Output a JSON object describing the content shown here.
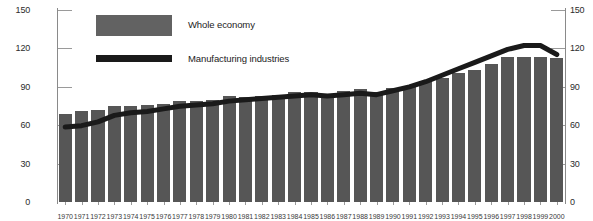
{
  "chart_data": {
    "type": "bar",
    "title": "",
    "subtitle": "",
    "xlabel": "",
    "ylabel": "",
    "ylim": [
      0,
      150
    ],
    "yticks": [
      0,
      30,
      60,
      90,
      120,
      150
    ],
    "grid": false,
    "legend_position": "top-left",
    "dual_axis": true,
    "categories": [
      "1970",
      "1971",
      "1972",
      "1973",
      "1974",
      "1975",
      "1976",
      "1977",
      "1978",
      "1979",
      "1980",
      "1981",
      "1982",
      "1983",
      "1984",
      "1985",
      "1986",
      "1987",
      "1988",
      "1989",
      "1990",
      "1991",
      "1992",
      "1993",
      "1994",
      "1995",
      "1996",
      "1997",
      "1998",
      "1999",
      "2000"
    ],
    "series": [
      {
        "name": "Whole economy",
        "type": "bar",
        "color": "#565656",
        "values": [
          68,
          70,
          71,
          74,
          74,
          75,
          76,
          78,
          78,
          79,
          82,
          81,
          82,
          83,
          85,
          85,
          83,
          86,
          87,
          85,
          88,
          90,
          93,
          96,
          100,
          102,
          107,
          112,
          112,
          112,
          111
        ]
      },
      {
        "name": "Manufacturing industries",
        "type": "line",
        "color": "#1a1a1a",
        "values": [
          58,
          59,
          62,
          67,
          69,
          70,
          72,
          74,
          75,
          76,
          78,
          79,
          80,
          81,
          82,
          83,
          82,
          83,
          84,
          83,
          86,
          89,
          93,
          98,
          103,
          108,
          113,
          118,
          121,
          121,
          114
        ]
      }
    ]
  },
  "axes": {
    "left": {
      "ticks": [
        "150",
        "120",
        "90",
        "60",
        "30",
        "0"
      ]
    },
    "right": {
      "ticks": [
        "150",
        "120",
        "90",
        "60",
        "30",
        "0"
      ]
    }
  },
  "legend": {
    "items": [
      {
        "label": "Whole economy",
        "swatch": "bar-swatch",
        "color": "#626262"
      },
      {
        "label": "Manufacturing industries",
        "swatch": "line-swatch",
        "color": "#1a1a1a"
      }
    ]
  }
}
